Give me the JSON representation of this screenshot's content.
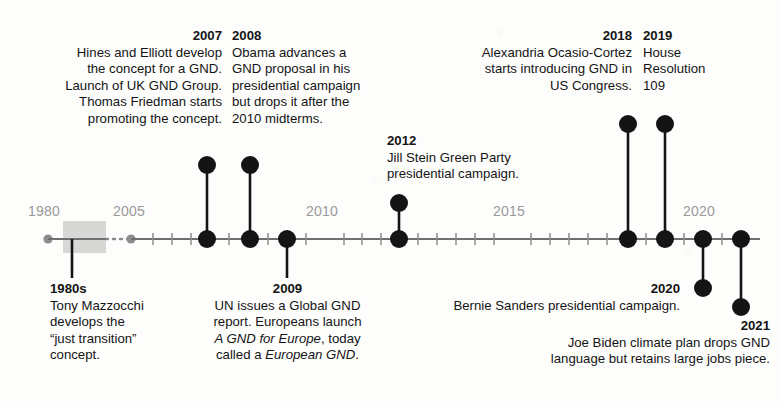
{
  "figure": {
    "kind": "timeline",
    "orientation": "horizontal",
    "colors": {
      "ink": "#141414",
      "axis": "#6f6f6f",
      "axis_label": "#9a9a9a",
      "highlight_box": "#c9c9c9",
      "paper": "#fdfdfc"
    }
  },
  "axis": {
    "labels": [
      {
        "text": "1980",
        "x": 48
      },
      {
        "text": "2005",
        "x": 131
      },
      {
        "text": "2010",
        "x": 325
      },
      {
        "text": "2015",
        "x": 512
      },
      {
        "text": "2020",
        "x": 702
      }
    ],
    "range_start": "1980",
    "range_end": "2021",
    "tick_spacing_years": 1,
    "break_style": "dotted",
    "highlight_span_label": "1980s"
  },
  "events": [
    {
      "id": "e-1980s",
      "year": "1980s",
      "side": "below",
      "align": "left",
      "body": "Tony Mazzocchi develops the “just transition” concept.",
      "lines": [
        "Tony Mazzocchi",
        "develops the",
        "“just transition”",
        "concept."
      ],
      "dot_x": 72
    },
    {
      "id": "e-2007",
      "year": "2007",
      "side": "above",
      "align": "right",
      "body": "Hines and Elliott develop the concept for a GND. Launch of UK GND Group. Thomas Friedman starts promoting the concept.",
      "lines": [
        "Hines and Elliott develop",
        "the concept for a GND.",
        "Launch of UK GND Group.",
        "Thomas Friedman starts",
        "promoting the concept."
      ],
      "dot_x": 207
    },
    {
      "id": "e-2008",
      "year": "2008",
      "side": "above",
      "align": "left",
      "body": "Obama advances a GND proposal in his presidential campaign but drops it after the 2010 midterms.",
      "lines": [
        "Obama advances a",
        "GND proposal in his",
        "presidential campaign",
        "but drops it after the",
        "2010 midterms."
      ],
      "dot_x": 250
    },
    {
      "id": "e-2009",
      "year": "2009",
      "side": "below",
      "align": "center",
      "body": "UN issues a Global GND report. Europeans launch A GND for Europe, today called a European GND.",
      "lines": [
        "UN issues a Global GND",
        "report. Europeans launch",
        "A GND for Europe, today",
        "called a European GND."
      ],
      "italic_phrases": [
        "A GND for Europe",
        "European GND"
      ],
      "dot_x": 287
    },
    {
      "id": "e-2012",
      "year": "2012",
      "side": "above",
      "align": "left",
      "body": "Jill Stein Green Party presidential campaign.",
      "lines": [
        "Jill Stein Green Party",
        "presidential campaign."
      ],
      "dot_x": 399
    },
    {
      "id": "e-2018",
      "year": "2018",
      "side": "above",
      "align": "right",
      "body": "Alexandria Ocasio-Cortez starts introducing GND in US Congress.",
      "lines": [
        "Alexandria Ocasio-Cortez",
        "starts introducing GND in",
        "US Congress."
      ],
      "dot_x": 628
    },
    {
      "id": "e-2019",
      "year": "2019",
      "side": "above",
      "align": "left",
      "body": "House Resolution 109",
      "lines": [
        "House",
        "Resolution",
        "109"
      ],
      "dot_x": 665
    },
    {
      "id": "e-2020",
      "year": "2020",
      "side": "below",
      "align": "right",
      "body": "Bernie Sanders presidential campaign.",
      "lines": [
        "Bernie Sanders presidential campaign."
      ],
      "dot_x": 703
    },
    {
      "id": "e-2021",
      "year": "2021",
      "side": "below",
      "align": "right",
      "body": "Joe Biden climate plan drops GND language but retains large jobs piece.",
      "lines": [
        "Joe Biden climate plan drops GND",
        "language but retains large jobs piece."
      ],
      "dot_x": 741
    }
  ]
}
